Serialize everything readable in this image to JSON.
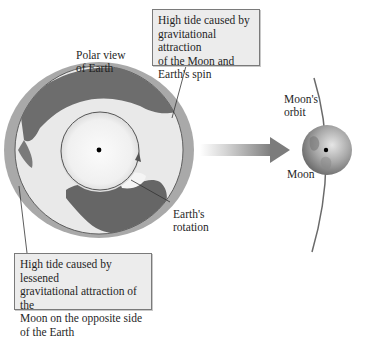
{
  "diagram": {
    "labels": {
      "polar_view": [
        "Polar view",
        "of Earth"
      ],
      "moons_orbit": [
        "Moon's",
        "orbit"
      ],
      "moon": "Moon",
      "earths_rotation": [
        "Earth's",
        "rotation"
      ]
    },
    "callouts": {
      "near_side": [
        "High tide caused by",
        "gravitational attraction",
        "of the Moon and",
        "Earth's spin"
      ],
      "far_side": [
        "High tide caused by lessened",
        "gravitational attraction of the",
        "Moon on the opposite side",
        "of the Earth"
      ]
    },
    "icons": {
      "earth": "earth-globe-icon",
      "moon": "moon-sphere-icon",
      "arrow": "gravity-direction-arrow-icon",
      "rotation": "rotation-arrow-icon"
    },
    "colors": {
      "tidal_bulge": "#a9a9a9",
      "ocean": "#e9e9e9",
      "land": "#6d6d6d",
      "ice": "#f7f7f7",
      "arrow_start": "#ffffff",
      "arrow_end": "#7c7c7c",
      "orbit": "#6a6a6a",
      "box_fill": "#ececec"
    }
  }
}
